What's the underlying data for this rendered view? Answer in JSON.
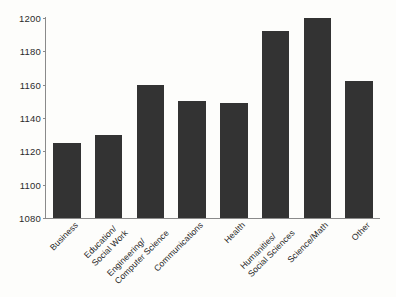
{
  "chart_data": {
    "type": "bar",
    "title": "",
    "subtitle": "",
    "xlabel": "",
    "ylabel": "",
    "ylim": [
      1080,
      1200
    ],
    "yticks": [
      1080,
      1100,
      1120,
      1140,
      1160,
      1180,
      1200
    ],
    "grid": false,
    "legend": null,
    "bar_color": "#333333",
    "background_color": "#fdfdfb",
    "axis_color": "#8a8a8a",
    "categories": [
      "Business",
      "Education/ Social Work",
      "Engineering/ Computer Science",
      "Communications",
      "Health",
      "Humanities/ Social Sciences",
      "Science/Math",
      "Other"
    ],
    "category_lines": [
      [
        "Business",
        ""
      ],
      [
        "Education/",
        "Social Work"
      ],
      [
        "Engineering/",
        "Computer Science"
      ],
      [
        "Communications",
        ""
      ],
      [
        "Health",
        ""
      ],
      [
        "Humanities/",
        "Social Sciences"
      ],
      [
        "Science/Math",
        ""
      ],
      [
        "Other",
        ""
      ]
    ],
    "values": [
      1125,
      1130,
      1160,
      1150,
      1149,
      1192,
      1200,
      1162
    ]
  }
}
